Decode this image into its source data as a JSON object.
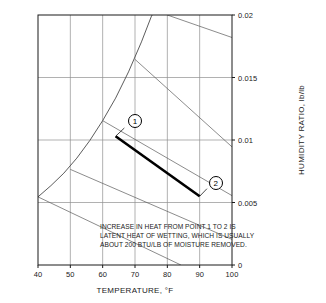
{
  "chart_data": {
    "type": "line",
    "title": "",
    "xlabel": "TEMPERATURE, °F",
    "ylabel": "HUMIDITY RATIO, lb/lb",
    "xlim": [
      40,
      100
    ],
    "ylim": [
      0,
      0.02
    ],
    "xticks": [
      40,
      50,
      60,
      70,
      80,
      90,
      100
    ],
    "xtick_labels": [
      "40",
      "50",
      "60",
      "70",
      "80",
      "90",
      "100"
    ],
    "yticks": [
      0,
      0.005,
      0.01,
      0.015,
      0.02
    ],
    "ytick_labels": [
      "0",
      "0.005",
      "0.01",
      "0.015",
      "0.02"
    ],
    "grid": true,
    "legend": "none",
    "saturation_curve": {
      "name": "saturation line (100% RH)",
      "points": [
        [
          40,
          0.00545
        ],
        [
          44,
          0.00635
        ],
        [
          48,
          0.00735
        ],
        [
          52,
          0.00855
        ],
        [
          56,
          0.00995
        ],
        [
          60,
          0.01155
        ],
        [
          64,
          0.01335
        ],
        [
          68,
          0.01545
        ],
        [
          72,
          0.01785
        ],
        [
          75,
          0.01985
        ],
        [
          75.3,
          0.02
        ]
      ]
    },
    "wet_bulb_lines": [
      {
        "label": "40",
        "start": [
          40,
          0.00545
        ],
        "end": [
          84.2,
          0
        ]
      },
      {
        "label": "50",
        "start": [
          50,
          0.00765
        ],
        "end": [
          100,
          0.00205
        ]
      },
      {
        "label": "60",
        "start": [
          60,
          0.01155
        ],
        "end": [
          100,
          0.00555
        ]
      },
      {
        "label": "70",
        "start": [
          70,
          0.01645
        ],
        "end": [
          100,
          0.00945
        ]
      },
      {
        "label": "80",
        "start": [
          80,
          0.02
        ],
        "end": [
          100,
          0.0182
        ]
      }
    ],
    "process_line": {
      "name": "latent heat of wetting process",
      "from_point": "1",
      "to_point": "2",
      "from": [
        64,
        0.0103
      ],
      "to": [
        90,
        0.0055
      ],
      "style": "thick solid",
      "color": "#000000"
    },
    "markers": [
      {
        "label": "1",
        "x": 64,
        "y": 0.0103,
        "label_offset": [
          6,
          0.0012
        ]
      },
      {
        "label": "2",
        "x": 90,
        "y": 0.0055,
        "label_offset": [
          5,
          0.0011
        ]
      }
    ],
    "annotation": {
      "lines": [
        "INCREASE IN HEAT FROM POINT 1 TO 2 IS",
        "LATENT HEAT OF WETTING, WHICH IS USUALLY",
        "ABOUT 200 BTU/LB OF MOISTURE REMOVED."
      ]
    },
    "colors": {
      "frame": "#1a1a1a",
      "grid": "#8f8f8f",
      "curve": "#4a4a4a",
      "process": "#000000",
      "text": "#1a1a1a",
      "background": "#ffffff"
    }
  }
}
